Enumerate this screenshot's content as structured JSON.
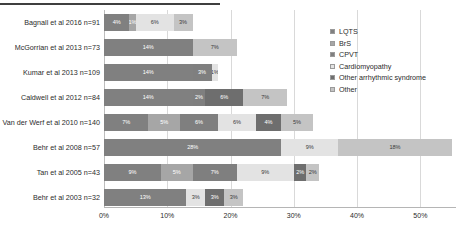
{
  "chart_data": {
    "type": "bar",
    "subtype": "stacked-horizontal-bar",
    "title": "",
    "xlabel": "",
    "ylabel": "",
    "xlim": [
      0,
      55
    ],
    "xticks": [
      "0%",
      "10%",
      "20%",
      "30%",
      "40%",
      "50%"
    ],
    "xtick_values": [
      0,
      10,
      20,
      30,
      40,
      50
    ],
    "grid": true,
    "legend_position": "right",
    "categories": [
      "Bagnall et al 2016 n=91",
      "McGorrian et al 2013 n=73",
      "Kumar et al 2013 n=109",
      "Caldwell et al 2012 n=84",
      "Van der Werf et al 2010 n=140",
      "Behr et al 2008 n=57",
      "Tan et al 2005 n=43",
      "Behr et al 2003 n=32"
    ],
    "series": [
      {
        "name": "LQTS",
        "color": "#808080",
        "values": [
          4,
          14,
          14,
          14,
          7,
          28,
          9,
          13
        ]
      },
      {
        "name": "BrS",
        "color": "#a6a6a6",
        "values": [
          1,
          0,
          0,
          0,
          5,
          0,
          5,
          0
        ]
      },
      {
        "name": "CPVT",
        "color": "#7f7f7f",
        "values": [
          0,
          0,
          3,
          2,
          6,
          0,
          7,
          0
        ]
      },
      {
        "name": "Cardiomyopathy",
        "color": "#e3e3e3",
        "values": [
          6,
          0,
          1,
          0,
          6,
          9,
          9,
          3
        ]
      },
      {
        "name": "Other arrhythmic syndrome",
        "color": "#6e6e6e",
        "values": [
          0,
          0,
          0,
          6,
          4,
          0,
          2,
          3
        ]
      },
      {
        "name": "Other",
        "color": "#c4c4c4",
        "values": [
          3,
          7,
          0,
          7,
          5,
          18,
          2,
          3
        ]
      }
    ],
    "bar_labels": [
      [
        "4%",
        "1%",
        "",
        "6%",
        "",
        "3%"
      ],
      [
        "14%",
        "",
        "",
        "",
        "",
        "7%"
      ],
      [
        "14%",
        "",
        "3%",
        "1%",
        "",
        ""
      ],
      [
        "14%",
        "",
        "2%",
        "",
        "6%",
        "7%"
      ],
      [
        "7%",
        "5%",
        "6%",
        "6%",
        "4%",
        "5%"
      ],
      [
        "28%",
        "",
        "",
        "9%",
        "",
        "18%"
      ],
      [
        "9%",
        "5%",
        "7%",
        "9%",
        "2%",
        "2%"
      ],
      [
        "13%",
        "",
        "",
        "3%",
        "3%",
        "3%"
      ]
    ]
  },
  "legend": {
    "items": [
      {
        "label": "LQTS",
        "color": "#808080"
      },
      {
        "label": "BrS",
        "color": "#a6a6a6"
      },
      {
        "label": "CPVT",
        "color": "#7f7f7f"
      },
      {
        "label": "Cardiomyopathy",
        "color": "#e3e3e3"
      },
      {
        "label": "Other arrhythmic syndrome",
        "color": "#6e6e6e"
      },
      {
        "label": "Other",
        "color": "#c4c4c4"
      }
    ]
  }
}
